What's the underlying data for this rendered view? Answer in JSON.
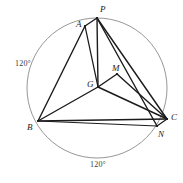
{
  "figure": {
    "type": "geometry-diagram",
    "canvas": {
      "width": 183,
      "height": 183,
      "background": "#ffffff"
    },
    "stroke_colors": {
      "segment": "#1b1b1b",
      "circle": "#8a8a8a",
      "text": "#1c1c1c",
      "arc_label_text": "#3a3a3a"
    },
    "circle": {
      "name": "circumscribed-circle",
      "cx": 97,
      "cy": 88,
      "r": 70,
      "stroke_width": 0.9
    },
    "points": [
      {
        "id": "P",
        "label": "P",
        "x": 97,
        "y": 18,
        "label_x": 100,
        "label_y": 5,
        "dot": true
      },
      {
        "id": "A",
        "label": "A",
        "x": 85,
        "y": 26,
        "label_x": 76,
        "label_y": 20,
        "dot": true
      },
      {
        "id": "B",
        "label": "B",
        "x": 38,
        "y": 121,
        "label_x": 27,
        "label_y": 123,
        "dot": true
      },
      {
        "id": "C",
        "label": "C",
        "x": 167,
        "y": 119,
        "label_x": 171,
        "label_y": 113,
        "dot": true
      },
      {
        "id": "N",
        "label": "N",
        "x": 157,
        "y": 126,
        "label_x": 158,
        "label_y": 130,
        "dot": true
      },
      {
        "id": "G",
        "label": "G",
        "x": 98,
        "y": 87,
        "label_x": 87,
        "label_y": 80,
        "dot": true
      },
      {
        "id": "M",
        "label": "M",
        "x": 117,
        "y": 74,
        "label_x": 112,
        "label_y": 64,
        "dot": true
      }
    ],
    "segments": [
      {
        "name": "segment-AP",
        "from": "A",
        "to": "P",
        "width": 1.4
      },
      {
        "name": "segment-AB",
        "from": "A",
        "to": "B",
        "width": 1.4
      },
      {
        "name": "segment-AG",
        "from": "A",
        "to": "G",
        "width": 1.2
      },
      {
        "name": "segment-PG",
        "from": "P",
        "to": "G",
        "width": 1.4
      },
      {
        "name": "segment-PC",
        "from": "P",
        "to": "C",
        "width": 1.4
      },
      {
        "name": "segment-PN",
        "from": "P",
        "to": "N",
        "width": 1.4
      },
      {
        "name": "segment-BG",
        "from": "B",
        "to": "G",
        "width": 1.4
      },
      {
        "name": "segment-BC",
        "from": "B",
        "to": "C",
        "width": 1.6
      },
      {
        "name": "segment-BN",
        "from": "B",
        "to": "N",
        "width": 1.2
      },
      {
        "name": "segment-GM",
        "from": "G",
        "to": "M",
        "width": 1.4
      },
      {
        "name": "segment-MC",
        "from": "M",
        "to": "C",
        "width": 1.4
      },
      {
        "name": "segment-GC",
        "from": "G",
        "to": "C",
        "width": 1.4
      },
      {
        "name": "segment-CN",
        "from": "C",
        "to": "N",
        "width": 1.2
      }
    ],
    "arc_labels": [
      {
        "name": "arc-label-left",
        "text": "120°",
        "x": 15,
        "y": 60
      },
      {
        "name": "arc-label-bottom",
        "text": "120°",
        "x": 90,
        "y": 161
      }
    ]
  }
}
